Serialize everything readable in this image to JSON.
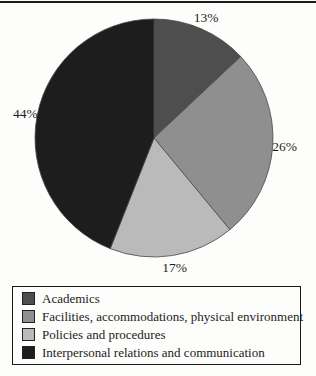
{
  "chart_data": {
    "type": "pie",
    "title": "",
    "direction": "clockwise",
    "start_angle_deg": 0,
    "legend_position": "bottom",
    "slices": [
      {
        "label": "Academics",
        "value": 13,
        "pct_label": "13%",
        "color": "#4e4e4e"
      },
      {
        "label": "Facilities, accommodations, physical environment",
        "value": 26,
        "pct_label": "26%",
        "color": "#8f8f8f"
      },
      {
        "label": "Policies and procedures",
        "value": 17,
        "pct_label": "17%",
        "color": "#bababa"
      },
      {
        "label": "Interpersonal relations and communication",
        "value": 44,
        "pct_label": "44%",
        "color": "#1d1d1d"
      }
    ]
  }
}
